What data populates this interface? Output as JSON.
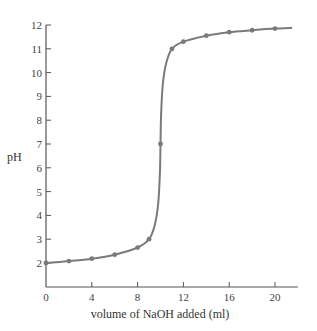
{
  "chart_data": {
    "type": "line",
    "title": "",
    "xlabel": "volume of NaOH added (ml)",
    "ylabel": "pH",
    "xlim": [
      0,
      22
    ],
    "ylim": [
      1,
      12
    ],
    "xticks": [
      0,
      4,
      8,
      12,
      16,
      20
    ],
    "yticks": [
      2,
      3,
      4,
      5,
      6,
      7,
      8,
      9,
      10,
      11,
      12
    ],
    "grid": false,
    "legend": null,
    "series": [
      {
        "name": "titration curve",
        "color": "#7a7a7a",
        "markers": true,
        "x": [
          0,
          2,
          4,
          6,
          8,
          9,
          10,
          11,
          12,
          14,
          16,
          18,
          20
        ],
        "y": [
          2.0,
          2.08,
          2.18,
          2.35,
          2.65,
          3.0,
          7.0,
          11.0,
          11.3,
          11.55,
          11.7,
          11.78,
          11.85
        ]
      }
    ]
  }
}
